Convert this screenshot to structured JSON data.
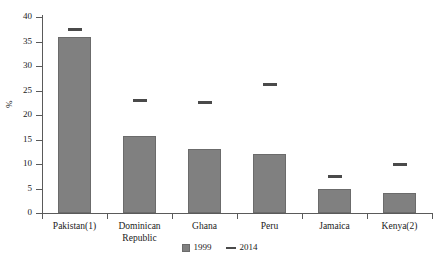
{
  "chart_data": {
    "type": "bar",
    "title": "",
    "xlabel": "",
    "ylabel": "%",
    "ylim": [
      0,
      40
    ],
    "yticks": [
      0,
      5,
      10,
      15,
      20,
      25,
      30,
      35,
      40
    ],
    "grid": false,
    "legend_position": "bottom-center",
    "categories": [
      "Pakistan(1)",
      "Dominican\nRepublic",
      "Ghana",
      "Peru",
      "Jamaica",
      "Kenya(2)"
    ],
    "series": [
      {
        "name": "1999",
        "type": "bar",
        "color": "#808080",
        "values": [
          36.0,
          15.7,
          13.0,
          12.1,
          5.0,
          4.0
        ]
      },
      {
        "name": "2014",
        "type": "marker-dash",
        "color": "#4a4a4a",
        "values": [
          37.5,
          23.0,
          22.5,
          26.2,
          7.5,
          10.0
        ]
      }
    ]
  },
  "legend": {
    "items": [
      {
        "label": "1999",
        "marker": "bar-swatch-icon"
      },
      {
        "label": "2014",
        "marker": "dash-marker-icon"
      }
    ]
  }
}
